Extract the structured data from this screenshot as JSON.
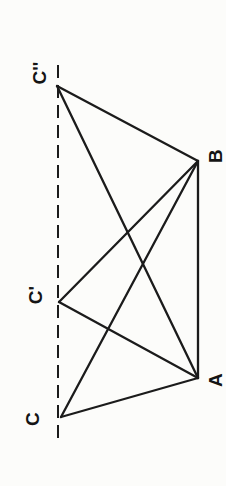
{
  "figure": {
    "width": 226,
    "height": 486,
    "background_color": "#fcfcfa",
    "stroke_color": "#1b1b1b",
    "label_color": "#141414",
    "stroke_width": 2.3,
    "dashed_stroke_width": 2,
    "label_font_size": 19,
    "label_rotation_deg": -90,
    "points": [
      {
        "id": "Cpp",
        "label": "C''",
        "x": 57,
        "y": 86,
        "label_x": 39,
        "label_y": 73
      },
      {
        "id": "Cp",
        "label": "C'",
        "x": 59,
        "y": 302,
        "label_x": 35,
        "label_y": 295
      },
      {
        "id": "C",
        "label": "C",
        "x": 61,
        "y": 417,
        "label_x": 32,
        "label_y": 419
      },
      {
        "id": "B",
        "label": "B",
        "x": 198,
        "y": 161,
        "label_x": 215,
        "label_y": 156
      },
      {
        "id": "A",
        "label": "A",
        "x": 198,
        "y": 378,
        "label_x": 215,
        "label_y": 380
      }
    ],
    "edges": [
      {
        "from": "Cpp",
        "to": "B"
      },
      {
        "from": "Cpp",
        "to": "A"
      },
      {
        "from": "Cp",
        "to": "B"
      },
      {
        "from": "Cp",
        "to": "A"
      },
      {
        "from": "C",
        "to": "B"
      },
      {
        "from": "C",
        "to": "A"
      },
      {
        "from": "B",
        "to": "A"
      }
    ],
    "dashed_line": {
      "x": 58,
      "y1": 65,
      "y2": 441,
      "dash_pattern": "13 7"
    }
  }
}
